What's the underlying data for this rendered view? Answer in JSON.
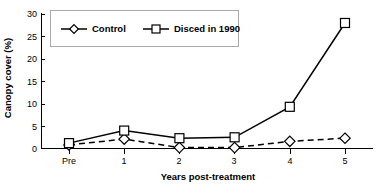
{
  "chart_data": {
    "type": "line",
    "title": "",
    "xlabel": "Years post-treatment",
    "ylabel": "Canopy cover (%)",
    "categories": [
      "Pre",
      "1",
      "2",
      "3",
      "4",
      "5"
    ],
    "ylim": [
      0,
      30
    ],
    "yticks": [
      0,
      5,
      10,
      15,
      20,
      25,
      30
    ],
    "ytick_labels": [
      "0",
      "5",
      "10",
      "15",
      "20",
      "25",
      "30"
    ],
    "grid": false,
    "legend_position": "top-left",
    "series": [
      {
        "name": "Control",
        "marker": "diamond",
        "line_style": "dashed",
        "values": [
          0.8,
          2.1,
          0.2,
          0.2,
          1.6,
          2.3
        ]
      },
      {
        "name": "Disced in 1990",
        "marker": "square",
        "line_style": "solid",
        "values": [
          1.2,
          4.0,
          2.3,
          2.5,
          9.3,
          28.0
        ]
      }
    ]
  },
  "axes": {
    "y_label": "Canopy cover (%)",
    "x_label": "Years post-treatment",
    "y_ticks": [
      "30",
      "25",
      "20",
      "15",
      "10",
      "5",
      "0"
    ],
    "x_ticks": [
      "Pre",
      "1",
      "2",
      "3",
      "4",
      "5"
    ]
  },
  "legend": {
    "entries": [
      {
        "label": "Control",
        "marker": "diamond-marker-icon"
      },
      {
        "label": "Disced in 1990",
        "marker": "square-marker-icon"
      }
    ]
  },
  "colors": {
    "line": "#000000",
    "marker_fill": "#ffffff",
    "legend_border": "#aaaaaa",
    "background": "#ffffff"
  }
}
